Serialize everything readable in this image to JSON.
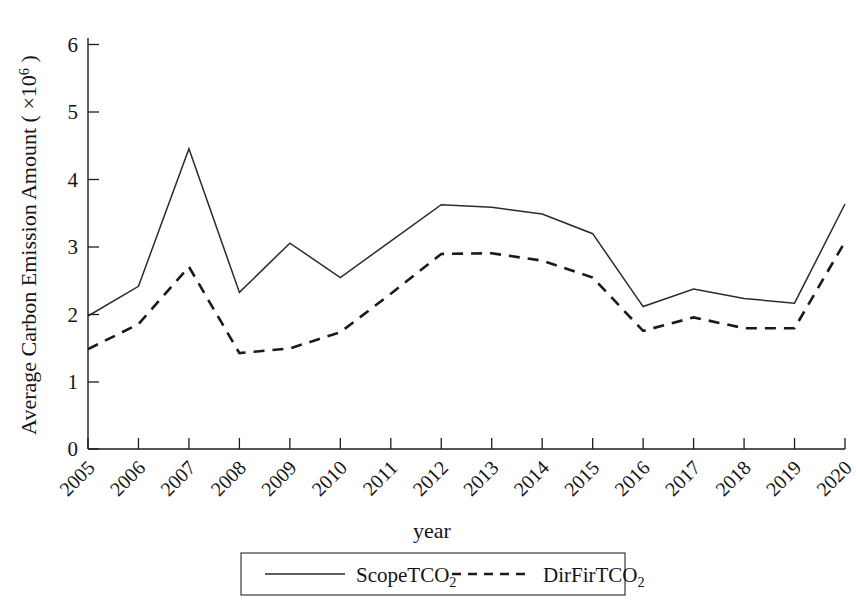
{
  "chart_data": {
    "type": "line",
    "title": "",
    "xlabel": "year",
    "ylabel": "Average Carbon Emission Amount ( ×10⁶ )",
    "ylabel_prefix": "Average Carbon Emission Amount ( ×10",
    "ylabel_exponent": "6",
    "ylabel_suffix": " )",
    "categories": [
      "2005",
      "2006",
      "2007",
      "2008",
      "2009",
      "2010",
      "2011",
      "2012",
      "2013",
      "2014",
      "2015",
      "2016",
      "2017",
      "2018",
      "2019",
      "2020"
    ],
    "x": [
      2005,
      2006,
      2007,
      2008,
      2009,
      2010,
      2011,
      2012,
      2013,
      2014,
      2015,
      2016,
      2017,
      2018,
      2019,
      2020
    ],
    "series": [
      {
        "name": "ScopeTCO2",
        "label_base": "ScopeTCO",
        "label_sub": "2",
        "style": "solid",
        "color": "#2b2b2b",
        "values": [
          1.97,
          2.41,
          4.45,
          2.32,
          3.05,
          2.54,
          3.08,
          3.62,
          3.58,
          3.48,
          3.19,
          2.11,
          2.37,
          2.23,
          2.16,
          3.63
        ]
      },
      {
        "name": "DirFirTCO2",
        "label_base": "DirFirTCO",
        "label_sub": "2",
        "style": "dashed",
        "color": "#1a1a1a",
        "values": [
          1.48,
          1.85,
          2.7,
          1.42,
          1.49,
          1.73,
          2.3,
          2.89,
          2.9,
          2.79,
          2.54,
          1.75,
          1.95,
          1.79,
          1.79,
          3.07
        ]
      }
    ],
    "yticks": [
      0,
      1,
      2,
      3,
      4,
      5,
      6
    ],
    "ytick_labels": [
      "0",
      "1",
      "2",
      "3",
      "4",
      "5",
      "6"
    ],
    "ylim": [
      0,
      6.3
    ],
    "xlim": [
      2005,
      2020
    ],
    "grid": false,
    "legend_position": "bottom-center",
    "xtick_rotation": 45
  },
  "legend": {
    "entries": [
      {
        "label_base": "ScopeTCO",
        "label_sub": "2",
        "style": "solid"
      },
      {
        "label_base": "DirFirTCO",
        "label_sub": "2",
        "style": "dashed"
      }
    ]
  }
}
